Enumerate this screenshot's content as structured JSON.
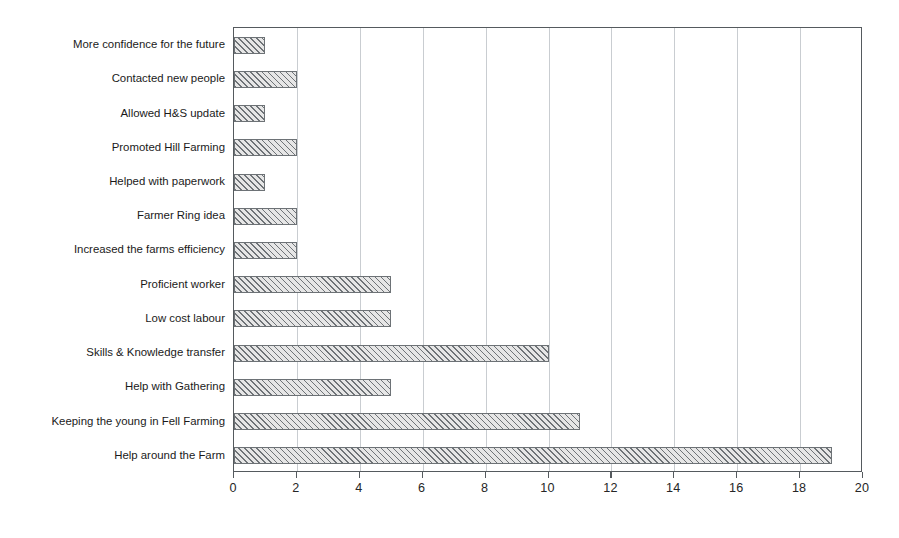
{
  "chart_data": {
    "type": "bar",
    "orientation": "horizontal",
    "title": "",
    "subtitle": "",
    "xlabel": "",
    "ylabel": "",
    "xlim": [
      0,
      20
    ],
    "xticks": [
      "0",
      "2",
      "4",
      "6",
      "8",
      "10",
      "12",
      "14",
      "16",
      "18",
      "20"
    ],
    "grid": "vertical",
    "legend": "none",
    "categories": [
      "More confidence for the future",
      "Contacted new people",
      "Allowed H&S update",
      "Promoted Hill Farming",
      "Helped with paperwork",
      "Farmer Ring idea",
      "Increased the farms efficiency",
      "Proficient worker",
      "Low cost labour",
      "Skills & Knowledge transfer",
      "Help with Gathering",
      "Keeping the young in Fell Farming",
      "Help around the Farm"
    ],
    "values": [
      1,
      2,
      1,
      2,
      1,
      2,
      2,
      5,
      5,
      10,
      5,
      11,
      19
    ],
    "bar_fill_color": "#e6e6e6",
    "bar_edge_color": "#6d7276",
    "bar_hatch": "diagonal-lines",
    "gridline_color": "#c9cdd1",
    "axis_color": "#555a5e",
    "background_color": "#ffffff"
  }
}
